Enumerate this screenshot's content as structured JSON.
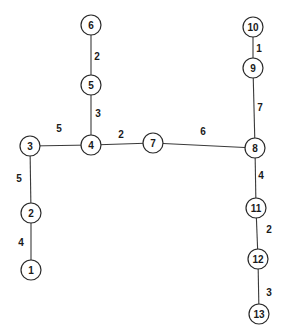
{
  "diagram": {
    "type": "weighted-tree",
    "node_radius": 10,
    "colors": {
      "stroke": "#2a2a2a",
      "fill": "#ffffff",
      "text": "#1a1a1a"
    },
    "nodes": [
      {
        "id": "1",
        "label": "1",
        "x": 31,
        "y": 270
      },
      {
        "id": "2",
        "label": "2",
        "x": 31,
        "y": 213
      },
      {
        "id": "3",
        "label": "3",
        "x": 30,
        "y": 146
      },
      {
        "id": "4",
        "label": "4",
        "x": 91,
        "y": 145
      },
      {
        "id": "5",
        "label": "5",
        "x": 91,
        "y": 85
      },
      {
        "id": "6",
        "label": "6",
        "x": 91,
        "y": 25
      },
      {
        "id": "7",
        "label": "7",
        "x": 153,
        "y": 143
      },
      {
        "id": "8",
        "label": "8",
        "x": 255,
        "y": 148
      },
      {
        "id": "9",
        "label": "9",
        "x": 253,
        "y": 68
      },
      {
        "id": "10",
        "label": "10",
        "x": 253,
        "y": 27
      },
      {
        "id": "11",
        "label": "11",
        "x": 256,
        "y": 208
      },
      {
        "id": "12",
        "label": "12",
        "x": 258,
        "y": 259
      },
      {
        "id": "13",
        "label": "13",
        "x": 259,
        "y": 314
      }
    ],
    "edges": [
      {
        "from": "6",
        "to": "5",
        "weight": "2",
        "lx": 97,
        "ly": 56
      },
      {
        "from": "5",
        "to": "4",
        "weight": "3",
        "lx": 98,
        "ly": 113
      },
      {
        "from": "3",
        "to": "4",
        "weight": "5",
        "lx": 59,
        "ly": 128
      },
      {
        "from": "4",
        "to": "7",
        "weight": "2",
        "lx": 121,
        "ly": 134
      },
      {
        "from": "7",
        "to": "8",
        "weight": "6",
        "lx": 203,
        "ly": 131
      },
      {
        "from": "3",
        "to": "2",
        "weight": "5",
        "lx": 19,
        "ly": 178
      },
      {
        "from": "2",
        "to": "1",
        "weight": "4",
        "lx": 21,
        "ly": 242
      },
      {
        "from": "10",
        "to": "9",
        "weight": "1",
        "lx": 259,
        "ly": 48
      },
      {
        "from": "9",
        "to": "8",
        "weight": "7",
        "lx": 260,
        "ly": 107
      },
      {
        "from": "8",
        "to": "11",
        "weight": "4",
        "lx": 261,
        "ly": 175
      },
      {
        "from": "11",
        "to": "12",
        "weight": "2",
        "lx": 269,
        "ly": 229
      },
      {
        "from": "12",
        "to": "13",
        "weight": "3",
        "lx": 269,
        "ly": 292
      }
    ]
  }
}
